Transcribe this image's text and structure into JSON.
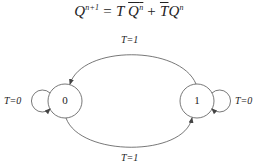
{
  "equation": {
    "lhs": "Q",
    "lhs_sup": "n+1",
    "equals": "=",
    "term1_coef": "T",
    "term1_var": "Q",
    "term1_sup": "n",
    "plus": "+",
    "term2_coef": "T",
    "term2_var": "Q",
    "term2_sup": "n"
  },
  "diagram": {
    "nodes": [
      {
        "id": "0",
        "label": "0"
      },
      {
        "id": "1",
        "label": "1"
      }
    ],
    "edges": [
      {
        "from": "0",
        "to": "0",
        "label": "T=0"
      },
      {
        "from": "1",
        "to": "1",
        "label": "T=0"
      },
      {
        "from": "1",
        "to": "0",
        "label": "T=1"
      },
      {
        "from": "0",
        "to": "1",
        "label": "T=1"
      }
    ]
  },
  "colors": {
    "stroke": "#555555",
    "text": "#222222"
  }
}
